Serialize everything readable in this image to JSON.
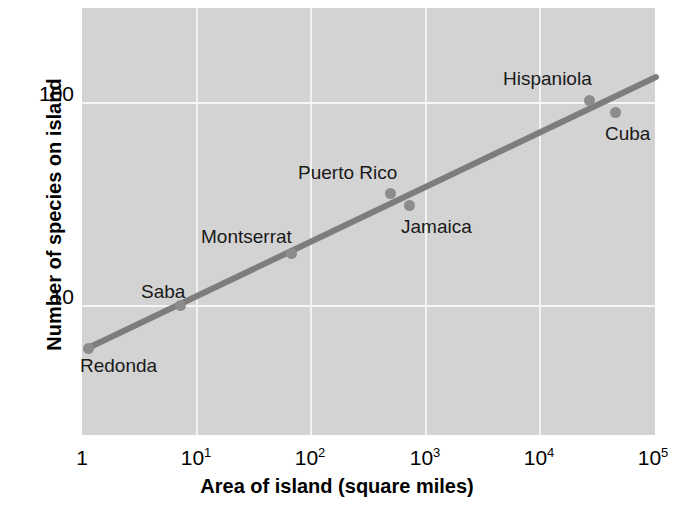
{
  "chart_data": {
    "type": "scatter",
    "title": "",
    "xlabel": "Area of island (square miles)",
    "ylabel": "Number of species on island",
    "xscale": "log",
    "yscale": "log",
    "xlim": [
      1,
      100000
    ],
    "ylim": [
      3,
      220
    ],
    "grid": true,
    "legend": "none",
    "x_ticks": [
      {
        "label": "1",
        "sup": "",
        "value": 1
      },
      {
        "label": "10",
        "sup": "1",
        "value": 10
      },
      {
        "label": "10",
        "sup": "2",
        "value": 100
      },
      {
        "label": "10",
        "sup": "3",
        "value": 1000
      },
      {
        "label": "10",
        "sup": "4",
        "value": 10000
      },
      {
        "label": "10",
        "sup": "5",
        "value": 100000
      }
    ],
    "y_ticks": [
      {
        "label": "10",
        "value": 10
      },
      {
        "label": "100",
        "value": 100
      }
    ],
    "points": [
      {
        "name": "Redonda",
        "x": 1.2,
        "y": 6.5
      },
      {
        "name": "Saba",
        "x": 7,
        "y": 10
      },
      {
        "name": "Montserrat",
        "x": 65,
        "y": 17
      },
      {
        "name": "Puerto Rico",
        "x": 500,
        "y": 33
      },
      {
        "name": "Jamaica",
        "x": 730,
        "y": 29
      },
      {
        "name": "Hispaniola",
        "x": 23000,
        "y": 98
      },
      {
        "name": "Cuba",
        "x": 41000,
        "y": 86
      }
    ],
    "trendline": {
      "label": "species-area regression",
      "x_start": 1.2,
      "y_start": 6.5,
      "x_end": 100000,
      "y_end": 122
    },
    "colors": {
      "plot_background": "#d3d3d3",
      "gridline": "#f4f4f4",
      "point": "#8c8c8c",
      "trendline": "#7d7d7d",
      "text": "#000000"
    }
  },
  "background_text": {
    "lines": [
      "islands are islands. The Caribbean",
      "species on each island. The data",
      "that the number of species rises",
      "on a logarithmic scale, so a straight",
      "power law relationship between",
      "area and number of species found",
      "on it. The slope of the line gives",
      "the exponent z in the equation",
      "S = cA to the power z, which for",
      "these islands is roughly 0.3, a value",
      "typical of many island systems that",
      "have been studied by ecologists."
    ]
  }
}
